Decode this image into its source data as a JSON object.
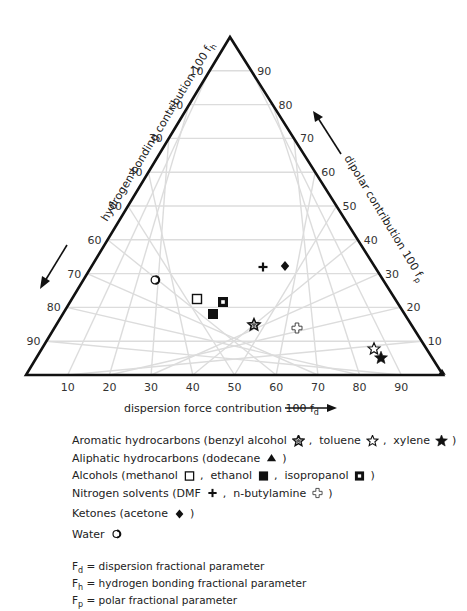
{
  "chart_data": {
    "type": "scatter",
    "subtype": "ternary (Teas graph)",
    "title": "",
    "axes": {
      "bottom": {
        "label": "dispersion force contribution 100 f",
        "label_sub": "d",
        "ticks": [
          "10",
          "20",
          "30",
          "40",
          "50",
          "60",
          "70",
          "80",
          "90"
        ],
        "direction": "left-to-right"
      },
      "left": {
        "label": "hydrogen bonding contribution 100 f",
        "label_sub": "h",
        "ticks": [
          "10",
          "20",
          "30",
          "40",
          "50",
          "60",
          "70",
          "80",
          "90"
        ],
        "direction": "top-to-bottom"
      },
      "right": {
        "label": "dipolar contribution 100 f",
        "label_sub": "p",
        "ticks": [
          "90",
          "80",
          "70",
          "60",
          "50",
          "40",
          "30",
          "20",
          "10"
        ],
        "direction": "bottom-to-top"
      }
    },
    "grid": true,
    "series": [
      {
        "name": "benzyl alcohol",
        "group": "Aromatic hydrocarbons",
        "marker": "star-outline-dotted",
        "fd": 47,
        "fp": 15,
        "fh": 38
      },
      {
        "name": "toluene",
        "group": "Aromatic hydrocarbons",
        "marker": "star-open",
        "fd": 80,
        "fp": 8,
        "fh": 12
      },
      {
        "name": "xylene",
        "group": "Aromatic hydrocarbons",
        "marker": "star-filled",
        "fd": 83,
        "fp": 5,
        "fh": 12
      },
      {
        "name": "dodecane",
        "group": "Aliphatic hydrocarbons",
        "marker": "triangle-filled",
        "fd": 100,
        "fp": 0,
        "fh": 0
      },
      {
        "name": "methanol",
        "group": "Alcohols",
        "marker": "square-open",
        "fd": 30,
        "fp": 22,
        "fh": 48
      },
      {
        "name": "ethanol",
        "group": "Alcohols",
        "marker": "square-filled",
        "fd": 36,
        "fp": 18,
        "fh": 46
      },
      {
        "name": "isopropanol",
        "group": "Alcohols",
        "marker": "square-dotted",
        "fd": 37,
        "fp": 21,
        "fh": 42
      },
      {
        "name": "DMF",
        "group": "Nitrogen solvents",
        "marker": "plus-filled",
        "fd": 41,
        "fp": 32,
        "fh": 27
      },
      {
        "name": "n-butylamine",
        "group": "Nitrogen solvents",
        "marker": "plus-open",
        "fd": 58,
        "fp": 14,
        "fh": 28
      },
      {
        "name": "acetone",
        "group": "Ketones",
        "marker": "diamond-filled",
        "fd": 46,
        "fp": 32,
        "fh": 22
      },
      {
        "name": "water",
        "group": "Water",
        "marker": "circle-open",
        "fd": 17,
        "fp": 28,
        "fh": 55
      }
    ],
    "legend_position": "below"
  },
  "plot": {
    "points_px": [
      {
        "name": "benzyl alcohol",
        "marker": "star-outline-dotted",
        "x": 254,
        "y": 325
      },
      {
        "name": "toluene",
        "marker": "star-open",
        "x": 374,
        "y": 349
      },
      {
        "name": "xylene",
        "marker": "star-filled",
        "x": 381,
        "y": 358
      },
      {
        "name": "dodecane",
        "marker": "triangle-filled",
        "x": 442,
        "y": 372
      },
      {
        "name": "methanol",
        "marker": "square-open",
        "x": 197,
        "y": 299
      },
      {
        "name": "ethanol",
        "marker": "square-filled",
        "x": 213,
        "y": 314
      },
      {
        "name": "isopropanol",
        "marker": "square-dotted",
        "x": 223,
        "y": 302
      },
      {
        "name": "DMF",
        "marker": "plus-filled",
        "x": 263,
        "y": 267
      },
      {
        "name": "n-butylamine",
        "marker": "plus-open",
        "x": 297,
        "y": 328
      },
      {
        "name": "acetone",
        "marker": "diamond-filled",
        "x": 285,
        "y": 266
      },
      {
        "name": "water",
        "marker": "circle-open",
        "x": 155,
        "y": 280
      }
    ],
    "grid_color": "#dcdcdc",
    "frame_color": "#111111"
  },
  "legend": {
    "rows": [
      {
        "parts": [
          "Aromatic hydrocarbons (benzyl alcohol",
          {
            "m": "star-outline-dotted"
          },
          ",  toluene",
          {
            "m": "star-open"
          },
          ",  xylene",
          {
            "m": "star-filled"
          },
          ")"
        ]
      },
      {
        "parts": [
          "Aliphatic hydrocarbons (dodecane",
          {
            "m": "triangle-filled"
          },
          ")"
        ]
      },
      {
        "parts": [
          "Alcohols (methanol",
          {
            "m": "square-open"
          },
          ",  ethanol",
          {
            "m": "square-filled"
          },
          ",  isopropanol",
          {
            "m": "square-dotted"
          },
          ")"
        ]
      },
      {
        "parts": [
          "Nitrogen solvents (DMF",
          {
            "m": "plus-filled"
          },
          ",  n-butylamine",
          {
            "m": "plus-open"
          },
          ")"
        ]
      },
      {
        "parts": [
          "Ketones (acetone",
          {
            "m": "diamond-filled"
          },
          ")"
        ]
      },
      {
        "parts": [
          "Water",
          {
            "m": "circle-open"
          }
        ]
      }
    ]
  },
  "definitions": [
    {
      "sym": "F",
      "sub": "d",
      "text": " = dispersion fractional parameter"
    },
    {
      "sym": "F",
      "sub": "h",
      "text": " = hydrogen bonding fractional parameter"
    },
    {
      "sym": "F",
      "sub": "p",
      "text": " = polar fractional parameter"
    }
  ]
}
